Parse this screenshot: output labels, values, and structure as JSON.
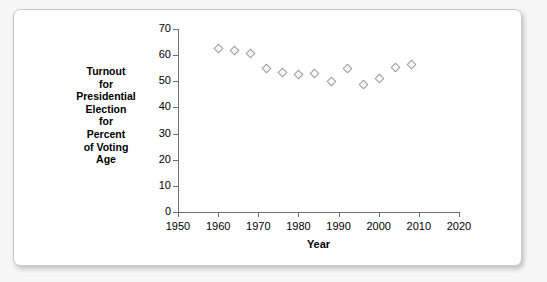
{
  "chart_data": {
    "type": "scatter",
    "title": "",
    "xlabel": "Year",
    "ylabel": "Turnout for Presidential Election for Percent of Voting Age",
    "ylabel_lines": [
      "Turnout",
      "for",
      "Presidential",
      "Election",
      "for",
      "Percent",
      "of Voting",
      "Age"
    ],
    "xlim": [
      1950,
      2020
    ],
    "ylim": [
      0,
      70
    ],
    "xticks": [
      1950,
      1960,
      1970,
      1980,
      1990,
      2000,
      2010,
      2020
    ],
    "yticks": [
      0,
      10,
      20,
      30,
      40,
      50,
      60,
      70
    ],
    "grid": false,
    "legend": "none",
    "marker": "open-diamond",
    "marker_color": "#9a9a9a",
    "x": [
      1960,
      1964,
      1968,
      1972,
      1976,
      1980,
      1984,
      1988,
      1992,
      1996,
      2000,
      2004,
      2008
    ],
    "values": [
      62.8,
      61.9,
      60.8,
      55.2,
      53.6,
      52.6,
      53.1,
      50.1,
      55.2,
      49.1,
      51.3,
      55.3,
      56.8
    ],
    "series": [
      {
        "name": "Voter turnout",
        "points": [
          {
            "x": 1960,
            "y": 62.8
          },
          {
            "x": 1964,
            "y": 61.9
          },
          {
            "x": 1968,
            "y": 60.8
          },
          {
            "x": 1972,
            "y": 55.2
          },
          {
            "x": 1976,
            "y": 53.6
          },
          {
            "x": 1980,
            "y": 52.6
          },
          {
            "x": 1984,
            "y": 53.1
          },
          {
            "x": 1988,
            "y": 50.1
          },
          {
            "x": 1992,
            "y": 55.2
          },
          {
            "x": 1996,
            "y": 49.1
          },
          {
            "x": 2000,
            "y": 51.3
          },
          {
            "x": 2004,
            "y": 55.3
          },
          {
            "x": 2008,
            "y": 56.8
          }
        ]
      }
    ]
  }
}
